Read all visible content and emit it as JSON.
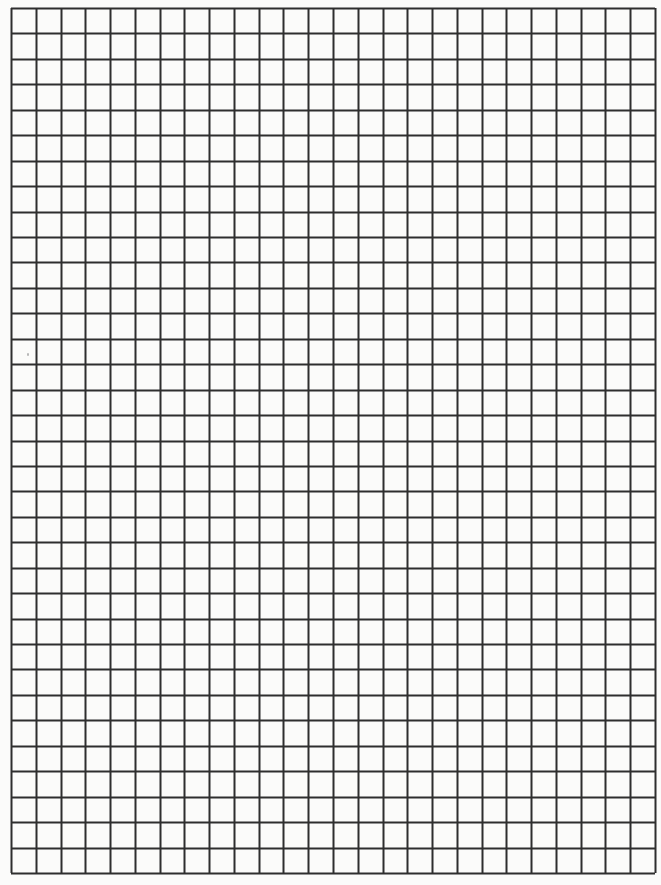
{
  "document": {
    "type": "grid-paper",
    "background_color": "#fbfbfa",
    "line_color": "#2e2e2e"
  },
  "grid": {
    "columns": 26,
    "rows": 34,
    "left": 11,
    "top": 8,
    "right": 655,
    "bottom": 873,
    "line_width": 2
  }
}
